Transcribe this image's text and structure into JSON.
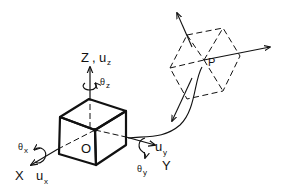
{
  "diagram": {
    "type": "3d-coordinate-system-schematic",
    "origin_label": "O",
    "point_label": "P",
    "axes": {
      "x": {
        "label": "X",
        "displacement": "u",
        "displacement_sub": "x",
        "rotation": "θ",
        "rotation_sub": "x"
      },
      "y": {
        "label": "Y",
        "displacement": "u",
        "displacement_sub": "y",
        "rotation": "θ",
        "rotation_sub": "y"
      },
      "z": {
        "label": "Z",
        "separator": ",",
        "displacement": "u",
        "displacement_sub": "z",
        "rotation": "θ",
        "rotation_sub": "z"
      }
    },
    "elements": [
      {
        "name": "origin-cube",
        "style": "solid-bold"
      },
      {
        "name": "point-cube",
        "style": "dashed"
      },
      {
        "name": "connecting-curve",
        "from": "P",
        "to": "O"
      }
    ],
    "colors": {
      "ink": "#111111",
      "background": "#ffffff"
    }
  }
}
